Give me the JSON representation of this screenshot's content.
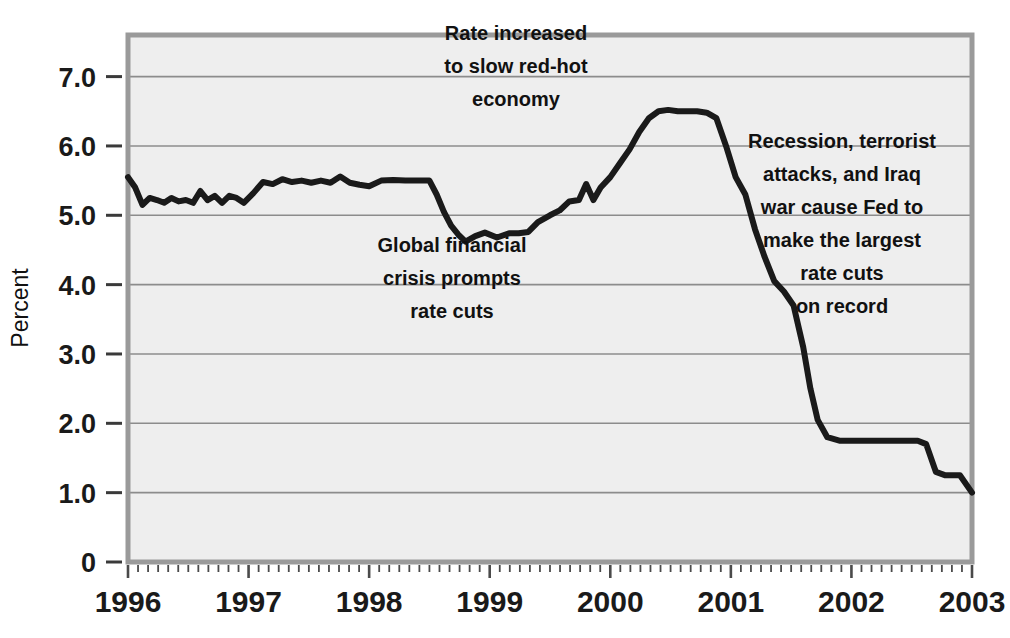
{
  "chart_data": {
    "type": "line",
    "title": "",
    "subtitle": "",
    "xlabel": "",
    "ylabel": "Percent",
    "xlim": [
      1996.0,
      2003.0
    ],
    "ylim": [
      0,
      7.6
    ],
    "grid": true,
    "grid_axis": "y",
    "legend": "none",
    "line_color": "#1a1a1a",
    "plot_background": "#eeeeee",
    "border_color": "#9a9a9a",
    "gridline_color": "#8c8c8c",
    "x_tick_labels": [
      "1996",
      "1997",
      "1998",
      "1999",
      "2000",
      "2001",
      "2002",
      "2003"
    ],
    "x_tick_values": [
      1996,
      1997,
      1998,
      1999,
      2000,
      2001,
      2002,
      2003
    ],
    "x_minor_ticks_per_year": 12,
    "y_tick_labels": [
      "7.0",
      "6.0",
      "5.0",
      "4.0",
      "3.0",
      "2.0",
      "1.0",
      "0"
    ],
    "y_tick_values": [
      7.0,
      6.0,
      5.0,
      4.0,
      3.0,
      2.0,
      1.0,
      0
    ],
    "series": [
      {
        "name": "Federal funds rate",
        "x": [
          1996.0,
          1996.06,
          1996.12,
          1996.18,
          1996.24,
          1996.3,
          1996.36,
          1996.42,
          1996.48,
          1996.54,
          1996.6,
          1996.66,
          1996.72,
          1996.78,
          1996.84,
          1996.9,
          1996.96,
          1997.04,
          1997.12,
          1997.2,
          1997.28,
          1997.36,
          1997.44,
          1997.52,
          1997.6,
          1997.68,
          1997.76,
          1997.84,
          1997.92,
          1998.0,
          1998.1,
          1998.2,
          1998.3,
          1998.4,
          1998.5,
          1998.56,
          1998.62,
          1998.68,
          1998.74,
          1998.8,
          1998.88,
          1998.96,
          1999.06,
          1999.16,
          1999.24,
          1999.32,
          1999.4,
          1999.5,
          1999.58,
          1999.66,
          1999.74,
          1999.8,
          1999.86,
          1999.92,
          2000.0,
          2000.08,
          2000.16,
          2000.24,
          2000.32,
          2000.4,
          2000.48,
          2000.56,
          2000.64,
          2000.72,
          2000.8,
          2000.88,
          2000.96,
          2001.04,
          2001.12,
          2001.2,
          2001.28,
          2001.36,
          2001.44,
          2001.52,
          2001.6,
          2001.66,
          2001.72,
          2001.8,
          2001.9,
          2002.0,
          2002.2,
          2002.4,
          2002.55,
          2002.62,
          2002.7,
          2002.78,
          2002.9,
          2003.0
        ],
        "y": [
          5.55,
          5.4,
          5.15,
          5.25,
          5.22,
          5.18,
          5.25,
          5.2,
          5.22,
          5.18,
          5.35,
          5.22,
          5.28,
          5.18,
          5.28,
          5.25,
          5.18,
          5.32,
          5.48,
          5.45,
          5.52,
          5.48,
          5.5,
          5.47,
          5.5,
          5.47,
          5.56,
          5.47,
          5.44,
          5.42,
          5.5,
          5.51,
          5.5,
          5.5,
          5.5,
          5.3,
          5.05,
          4.85,
          4.72,
          4.62,
          4.7,
          4.75,
          4.68,
          4.74,
          4.74,
          4.76,
          4.9,
          5.0,
          5.07,
          5.2,
          5.22,
          5.45,
          5.22,
          5.4,
          5.55,
          5.75,
          5.95,
          6.2,
          6.4,
          6.5,
          6.52,
          6.5,
          6.5,
          6.5,
          6.48,
          6.4,
          6.0,
          5.55,
          5.3,
          4.8,
          4.4,
          4.05,
          3.9,
          3.7,
          3.1,
          2.5,
          2.05,
          1.8,
          1.75,
          1.75,
          1.75,
          1.75,
          1.75,
          1.7,
          1.3,
          1.25,
          1.25,
          1.0
        ]
      }
    ],
    "annotations": [
      {
        "id": "rate-increased",
        "lines": [
          "Rate increased",
          "to slow red-hot",
          "economy"
        ],
        "x_center": 516,
        "y_top": 40
      },
      {
        "id": "global-financial-crisis",
        "lines": [
          "Global financial",
          "crisis prompts",
          "rate cuts"
        ],
        "x_center": 452,
        "y_top": 252
      },
      {
        "id": "recession-terrorist-attacks",
        "lines": [
          "Recession, terrorist",
          "attacks, and Iraq",
          "war cause Fed to",
          "make the largest",
          "rate cuts",
          "on record"
        ],
        "x_center": 842,
        "y_top": 148
      }
    ]
  }
}
